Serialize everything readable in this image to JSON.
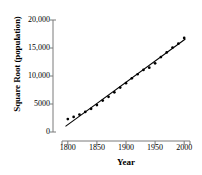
{
  "chart_data": {
    "type": "scatter",
    "title": "",
    "subtitle": "",
    "xlabel": "Year",
    "ylabel": "Square Root (population)",
    "xlim": [
      1790,
      2010
    ],
    "ylim": [
      0,
      20000
    ],
    "xticks": [
      1800,
      1850,
      1900,
      1950,
      2000
    ],
    "xticklabels": [
      "1800",
      "1850",
      "1900",
      "1950",
      "2000"
    ],
    "yticks": [
      0,
      5000,
      10000,
      15000,
      20000
    ],
    "yticklabels": [
      "0",
      "5000",
      "10,000",
      "15,000",
      "20,000"
    ],
    "grid": false,
    "legend": null,
    "marker_color": "#000000",
    "line_color": "#000000",
    "axis_color": "#7a7a7a",
    "series": [
      {
        "name": "Square Root (population)",
        "kind": "scatter",
        "x": [
          1800,
          1810,
          1820,
          1830,
          1840,
          1850,
          1860,
          1870,
          1880,
          1890,
          1900,
          1910,
          1920,
          1930,
          1940,
          1950,
          1960,
          1970,
          1980,
          1990,
          2000
        ],
        "y": [
          2310,
          2690,
          3110,
          3580,
          4130,
          4810,
          5610,
          6280,
          7080,
          7940,
          8720,
          9580,
          10310,
          11080,
          11480,
          12260,
          13380,
          14210,
          15070,
          15780,
          16800
        ]
      },
      {
        "name": "fitted line",
        "kind": "line",
        "x": [
          1796,
          2002
        ],
        "y": [
          1000,
          16600
        ]
      }
    ],
    "annotations": []
  }
}
